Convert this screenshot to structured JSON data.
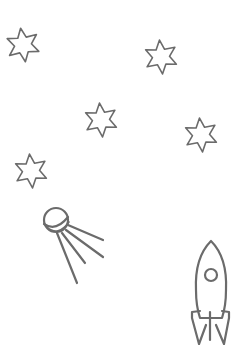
{
  "canvas": {
    "width": 243,
    "height": 361,
    "background": "#ffffff"
  },
  "style": {
    "stroke_color": "#6b6b6b",
    "stroke_width": 1.6,
    "thick_stroke_width": 2.2
  },
  "stars": [
    {
      "id": "star-1",
      "icon": "six-point-star-icon",
      "cx": 23,
      "cy": 45,
      "r": 17,
      "rotation": -8
    },
    {
      "id": "star-2",
      "icon": "six-point-star-icon",
      "cx": 161,
      "cy": 57,
      "r": 17,
      "rotation": -5
    },
    {
      "id": "star-3",
      "icon": "six-point-star-icon",
      "cx": 101,
      "cy": 120,
      "r": 17,
      "rotation": -5
    },
    {
      "id": "star-4",
      "icon": "six-point-star-icon",
      "cx": 201,
      "cy": 135,
      "r": 17,
      "rotation": -5
    },
    {
      "id": "star-5",
      "icon": "six-point-star-icon",
      "cx": 31,
      "cy": 171,
      "r": 17,
      "rotation": -5
    }
  ],
  "sputnik": {
    "icon": "satellite-icon",
    "sphere": {
      "cx": 56,
      "cy": 220,
      "r": 12
    },
    "antennas": [
      {
        "x1": 68,
        "y1": 225,
        "x2": 103,
        "y2": 240
      },
      {
        "x1": 66,
        "y1": 230,
        "x2": 103,
        "y2": 257
      },
      {
        "x1": 62,
        "y1": 233,
        "x2": 85,
        "y2": 263
      },
      {
        "x1": 57,
        "y1": 233,
        "x2": 77,
        "y2": 283
      }
    ]
  },
  "rocket": {
    "icon": "rocket-icon",
    "tip": {
      "x": 211,
      "y": 241
    },
    "window": {
      "cx": 211,
      "cy": 275,
      "r": 6
    }
  }
}
